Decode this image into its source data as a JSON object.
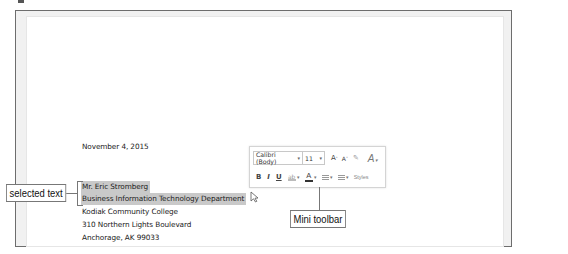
{
  "document": {
    "date": "November 4, 2015",
    "address_lines": [
      {
        "text": "Mr. Eric Stromberg",
        "selected": true
      },
      {
        "text": "Business Information Technology Department",
        "selected": true
      },
      {
        "text": "Kodiak Community College",
        "selected": false
      },
      {
        "text": "310 Northern Lights Boulevard",
        "selected": false
      },
      {
        "text": "Anchorage, AK 99033",
        "selected": false
      }
    ],
    "selection_color": "#c9c9c9"
  },
  "mini_toolbar": {
    "font_name": "Calibri (Body)",
    "font_size": "11",
    "grow_font_label": "A",
    "shrink_font_label": "A",
    "format_painter_icon": "format-painter-icon",
    "styles_icon": "styles-icon",
    "bold_label": "B",
    "italic_label": "I",
    "underline_label": "U",
    "highlight_icon": "highlight-icon",
    "font_color_label": "A",
    "bullets_icon": "bullets-icon",
    "numbering_icon": "numbering-icon",
    "styles_label": "Styles"
  },
  "callouts": {
    "selected_text": "selected text",
    "mini_toolbar": "Mini toolbar"
  }
}
